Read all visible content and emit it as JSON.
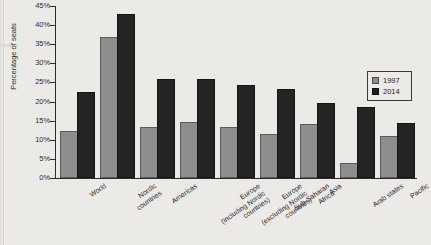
{
  "chart_data": {
    "type": "bar",
    "title": "",
    "subtitle": "",
    "xlabel": "",
    "ylabel": "Percentage of seats",
    "ylim": [
      0,
      45
    ],
    "ytick_step": 5,
    "ytick_labels": [
      "45%",
      "40%",
      "35%",
      "30%",
      "25%",
      "20%",
      "15%",
      "10%",
      "5%",
      "0%"
    ],
    "ytick_values": [
      45,
      40,
      35,
      30,
      25,
      20,
      15,
      10,
      5,
      0
    ],
    "grid": false,
    "legend_position": "right",
    "categories": [
      "World",
      "Nordic countries",
      "Americas",
      "Europe (including Nordic countries)",
      "Europe (excluding Nordic countries)",
      "Sub-Saharan Africa",
      "Asia",
      "Arab states",
      "Pacific"
    ],
    "category_lines": [
      [
        "World"
      ],
      [
        "Nordic",
        "countries"
      ],
      [
        "Americas"
      ],
      [
        "Europe",
        "(including Nordic",
        "countries)"
      ],
      [
        "Europe",
        "(excluding Nordic",
        "countries)"
      ],
      [
        "Sub-Saharan",
        "Africa"
      ],
      [
        "Asia"
      ],
      [
        "Arab states"
      ],
      [
        "Pacific"
      ]
    ],
    "series": [
      {
        "name": "1997",
        "color": "#8d8d8d",
        "values": [
          11.9,
          36.4,
          12.9,
          14.1,
          12.7,
          10.9,
          13.6,
          3.4,
          10.5
        ]
      },
      {
        "name": "2014",
        "color": "#242424",
        "values": [
          22.1,
          42.4,
          25.5,
          25.4,
          23.7,
          22.8,
          19.0,
          18.0,
          14.0
        ]
      }
    ]
  },
  "legend": {
    "items": [
      {
        "label": "1997"
      },
      {
        "label": "2014"
      }
    ]
  }
}
